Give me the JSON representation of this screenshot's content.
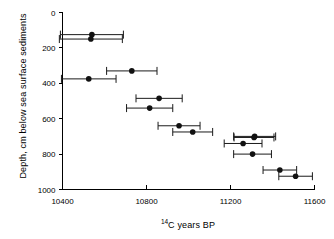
{
  "chart_data": {
    "type": "scatter",
    "title": "",
    "subtitle": "",
    "xlabel": "14C years BP",
    "xlabel_prefix_sup": "14",
    "xlabel_rest": "C years BP",
    "ylabel": "Depth, cm below sea surface sediments",
    "xlim": [
      10400,
      11600
    ],
    "ylim": [
      0,
      1000
    ],
    "y_inverted": true,
    "xticks": [
      10400,
      10800,
      11200,
      11600
    ],
    "xtick_labels": [
      "10400",
      "10800",
      "11200",
      "11600"
    ],
    "yticks": [
      0,
      200,
      400,
      600,
      800,
      1000
    ],
    "ytick_labels": [
      "0",
      "200",
      "400",
      "600",
      "800",
      "1000"
    ],
    "grid": false,
    "legend": null,
    "marker": "filled-circle",
    "marker_color": "#111111",
    "error_bar_orientation": "horizontal",
    "error_bar_color": "#1a1a1a",
    "points": [
      {
        "x": 10540,
        "y": 125,
        "xerr": 150
      },
      {
        "x": 10535,
        "y": 150,
        "xerr": 150
      },
      {
        "x": 10525,
        "y": 375,
        "xerr": 130
      },
      {
        "x": 10730,
        "y": 330,
        "xerr": 120
      },
      {
        "x": 10860,
        "y": 485,
        "xerr": 110
      },
      {
        "x": 10815,
        "y": 540,
        "xerr": 110
      },
      {
        "x": 10955,
        "y": 640,
        "xerr": 100
      },
      {
        "x": 11020,
        "y": 675,
        "xerr": 95
      },
      {
        "x": 11315,
        "y": 700,
        "xerr": 100
      },
      {
        "x": 11312,
        "y": 706,
        "xerr": 95
      },
      {
        "x": 11260,
        "y": 740,
        "xerr": 90
      },
      {
        "x": 11305,
        "y": 800,
        "xerr": 90
      },
      {
        "x": 11435,
        "y": 890,
        "xerr": 80
      },
      {
        "x": 11510,
        "y": 925,
        "xerr": 80
      }
    ]
  },
  "axes": {
    "x_title_sup": "14",
    "x_title_main": "C years BP",
    "y_title": "Depth, cm below sea surface sediments"
  }
}
